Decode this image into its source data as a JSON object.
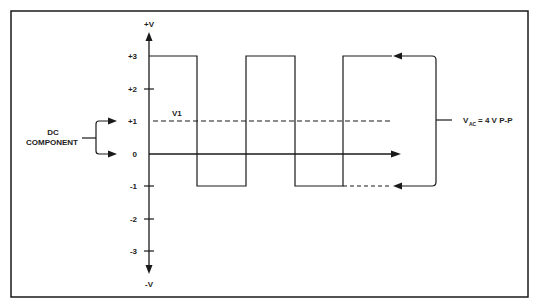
{
  "diagram": {
    "type": "waveform",
    "axes": {
      "y_top_label": "+V",
      "y_bottom_label": "-V",
      "y_ticks": [
        "+3",
        "+2",
        "+1",
        "0",
        "-1",
        "-2",
        "-3"
      ]
    },
    "labels": {
      "v1": "V1",
      "dc_line1": "DC",
      "dc_line2": "COMPONENT",
      "vac_main": "V",
      "vac_sub": "AC",
      "vac_value": "= 4 V P-P"
    },
    "waveform": {
      "high_level": 3,
      "low_level": -1,
      "dc_level": 1,
      "peak_to_peak": 4
    },
    "colors": {
      "line": "#1a1a1a",
      "background": "#ffffff"
    }
  }
}
